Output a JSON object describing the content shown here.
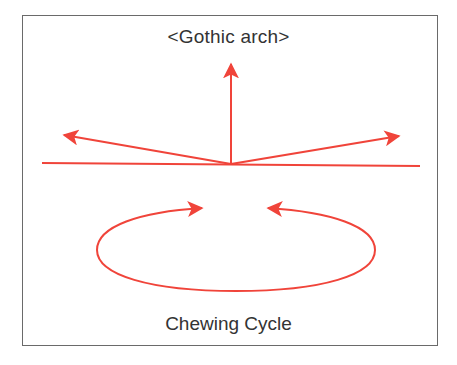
{
  "diagram": {
    "title": "<Gothic arch>",
    "caption": "Chewing Cycle",
    "colors": {
      "arrow": "#F0443A",
      "border": "#6A6A6A",
      "text": "#333333",
      "background": "#FFFFFF"
    },
    "elements": {
      "horizontal_line": "baseline",
      "arrows": [
        "left-lateral",
        "vertical-protrusion",
        "right-lateral"
      ],
      "cycle": "elliptical chewing cycle with two inward arrows"
    }
  }
}
